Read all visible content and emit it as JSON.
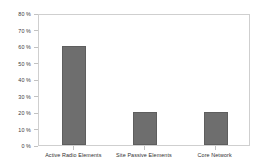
{
  "figure": {
    "background_color": "#ffffff",
    "frame_color": "#cfcfcf",
    "tick_color": "#c2c2c2",
    "label_color": "#3a3a3a"
  },
  "chart_data": {
    "type": "bar",
    "title": "",
    "subtitle": "",
    "xlabel": "",
    "ylabel": "",
    "categories": [
      "Active Radio Elements",
      "Site Passive Elements",
      "Core Network"
    ],
    "values": [
      60,
      20,
      20
    ],
    "value_unit": "%",
    "ylim": [
      0,
      80
    ],
    "ytick_values": [
      0,
      10,
      20,
      30,
      40,
      50,
      60,
      70,
      80
    ],
    "ytick_labels": [
      "0 %",
      "10 %",
      "20 %",
      "30 %",
      "40 %",
      "50 %",
      "60 %",
      "70 %",
      "80 %"
    ],
    "bar_color": "#6e6e6e",
    "bar_edge_color": "#5e5e5e",
    "grid": false,
    "legend": false,
    "legend_position": "none",
    "annotations": []
  }
}
